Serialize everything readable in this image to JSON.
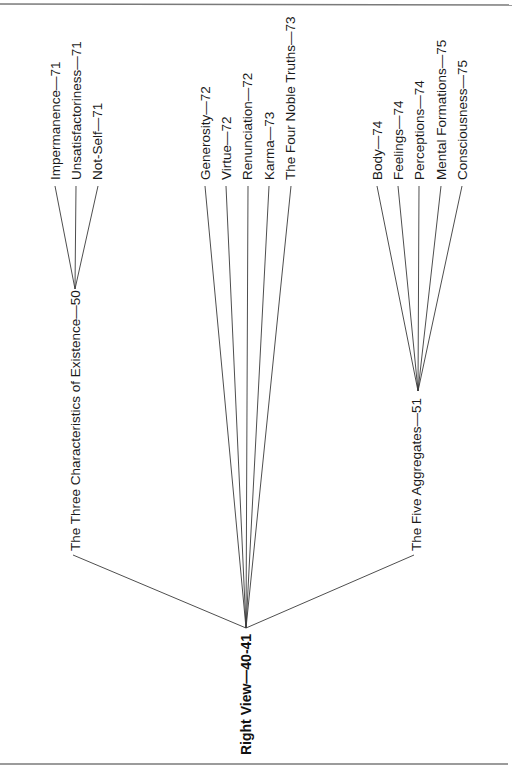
{
  "diagram": {
    "orientation": "rotated-90-ccw",
    "root": {
      "label": "Right View—40-41"
    },
    "branches": [
      {
        "label": "The Three Characteristics of Existence—50",
        "children": [
          {
            "label": "Impermanence—71"
          },
          {
            "label": "Unsatisfactoriness—71"
          },
          {
            "label": "Not-Self—71"
          }
        ]
      },
      {
        "label": "",
        "direct_children": [
          {
            "label": "Generosity—72"
          },
          {
            "label": "Virtue—72"
          },
          {
            "label": "Renunciation—72"
          },
          {
            "label": "Karma—73"
          },
          {
            "label": "The Four Noble Truths—73"
          }
        ]
      },
      {
        "label": "The Five Aggregates—51",
        "children": [
          {
            "label": "Body—74"
          },
          {
            "label": "Feelings—74"
          },
          {
            "label": "Perceptions—74"
          },
          {
            "label": "Mental Formations—75"
          },
          {
            "label": "Consciousness—75"
          }
        ]
      }
    ],
    "colors": {
      "line": "#3a3a3a",
      "rule": "#7a7a7a",
      "text": "#1a1a1a",
      "background": "#ffffff"
    }
  }
}
